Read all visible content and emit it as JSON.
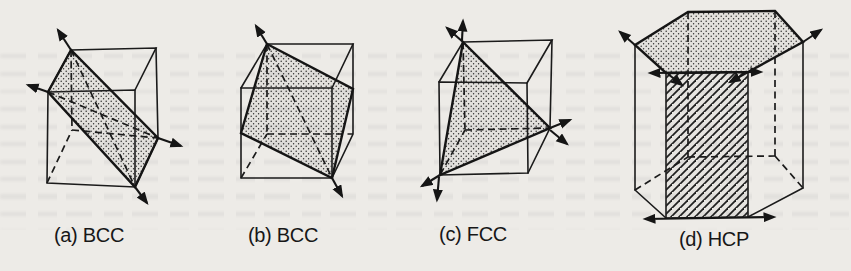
{
  "page": {
    "paper_color": "#edebe7",
    "ink_color": "#1b1b1b",
    "description_visible_text_only": true
  },
  "figures": [
    {
      "id": "a",
      "caption": "(a) BCC"
    },
    {
      "id": "b",
      "caption": "(b) BCC"
    },
    {
      "id": "c",
      "caption": "(c) FCC"
    },
    {
      "id": "d",
      "caption": "(d) HCP"
    }
  ]
}
